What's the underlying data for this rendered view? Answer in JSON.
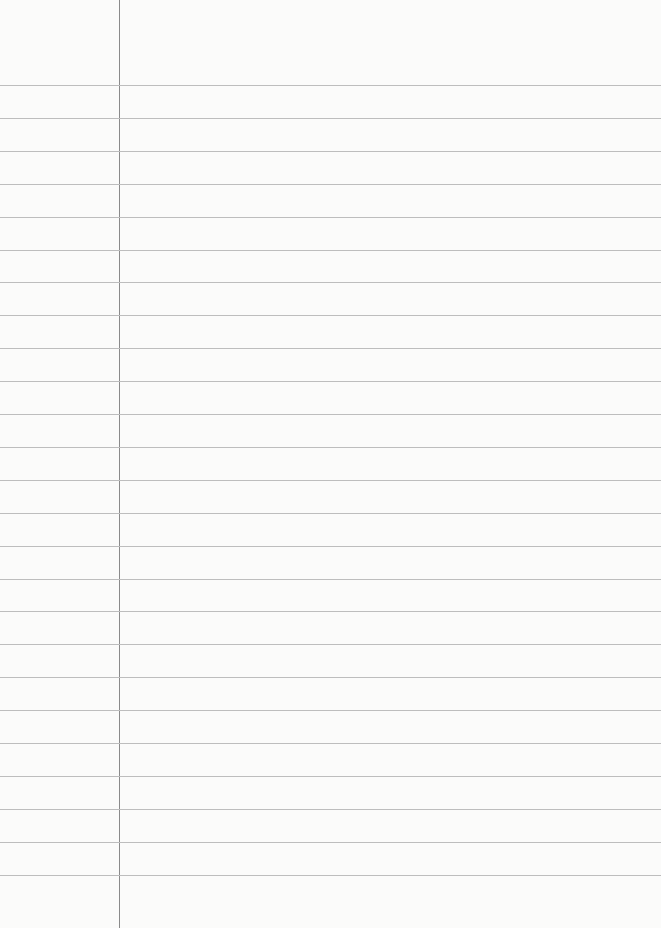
{
  "paper": {
    "type": "lined-paper",
    "background": "#fbfbfa",
    "rule_color": "#bdbdbd",
    "margin_color": "#8a8a8a",
    "margin_x": 119,
    "first_rule_y": 85,
    "rule_spacing": 32.9,
    "rule_count": 25
  }
}
